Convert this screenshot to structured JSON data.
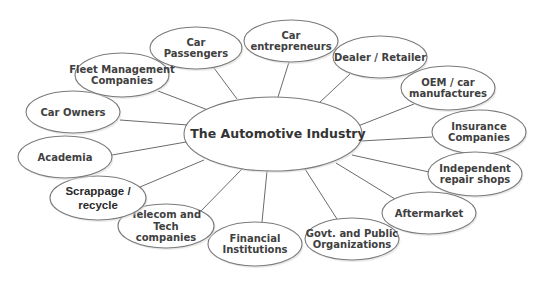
{
  "diagram": {
    "title": "The Automotive Industry",
    "center": {
      "id": "automotive-industry",
      "label": "The Automotive Industry",
      "cx": 273,
      "cy": 134,
      "rx": 89,
      "ry": 37
    },
    "colors": {
      "stroke": "#7a7a7a",
      "edge": "#6b6b6b",
      "text": "#404040",
      "fill": "#ffffff"
    },
    "nodes": [
      {
        "id": "car-passengers",
        "lines": [
          "Car",
          "Passengers"
        ],
        "cx": 196,
        "cy": 48,
        "rx": 46,
        "ry": 21,
        "edge_from": [
          237,
          99
        ],
        "edge_to": [
          214,
          68
        ]
      },
      {
        "id": "car-entrepreneurs",
        "lines": [
          "Car",
          "entrepreneurs"
        ],
        "cx": 291,
        "cy": 41,
        "rx": 47,
        "ry": 21,
        "edge_from": [
          278,
          97
        ],
        "edge_to": [
          289,
          62
        ]
      },
      {
        "id": "dealer-retailer",
        "lines": [
          "Dealer / Retailer"
        ],
        "cx": 380,
        "cy": 57,
        "rx": 47,
        "ry": 21,
        "edge_from": [
          319,
          103
        ],
        "edge_to": [
          350,
          74
        ]
      },
      {
        "id": "oem-car-manufactures",
        "lines": [
          "OEM / car",
          "manufactures"
        ],
        "cx": 448,
        "cy": 88,
        "rx": 47,
        "ry": 22,
        "edge_from": [
          358,
          126
        ],
        "edge_to": [
          414,
          104
        ]
      },
      {
        "id": "insurance-companies",
        "lines": [
          "Insurance",
          "Companies"
        ],
        "cx": 479,
        "cy": 132,
        "rx": 47,
        "ry": 22,
        "edge_from": [
          361,
          141
        ],
        "edge_to": [
          432,
          137
        ]
      },
      {
        "id": "independent-repair-shops",
        "lines": [
          "Independent",
          "repair shops"
        ],
        "cx": 475,
        "cy": 174,
        "rx": 47,
        "ry": 22,
        "edge_from": [
          352,
          155
        ],
        "edge_to": [
          429,
          172
        ]
      },
      {
        "id": "aftermarket",
        "lines": [
          "Aftermarket"
        ],
        "cx": 429,
        "cy": 213,
        "rx": 47,
        "ry": 21,
        "edge_from": [
          336,
          163
        ],
        "edge_to": [
          395,
          199
        ]
      },
      {
        "id": "govt-public-organizations",
        "lines": [
          "Govt. and Public",
          "Organizations"
        ],
        "cx": 352,
        "cy": 239,
        "rx": 47,
        "ry": 21,
        "edge_from": [
          305,
          169
        ],
        "edge_to": [
          337,
          219
        ]
      },
      {
        "id": "financial-institutions",
        "lines": [
          "Financial",
          "Institutions"
        ],
        "cx": 255,
        "cy": 244,
        "rx": 47,
        "ry": 22,
        "edge_from": [
          267,
          171
        ],
        "edge_to": [
          262,
          222
        ]
      },
      {
        "id": "telecom-tech-companies",
        "lines": [
          "Telecom and",
          "Tech",
          "companies"
        ],
        "cx": 166,
        "cy": 226,
        "rx": 48,
        "ry": 22,
        "edge_from": [
          243,
          168
        ],
        "edge_to": [
          200,
          212
        ]
      },
      {
        "id": "scrappage-recycle",
        "lines": [
          "Scrappage /",
          "recycle"
        ],
        "cx": 98,
        "cy": 198,
        "rx": 48,
        "ry": 22,
        "style": "alt",
        "edge_from": [
          204,
          160
        ],
        "edge_to": [
          140,
          187
        ]
      },
      {
        "id": "academia",
        "lines": [
          "Academia"
        ],
        "cx": 65,
        "cy": 157,
        "rx": 47,
        "ry": 21,
        "edge_from": [
          186,
          142
        ],
        "edge_to": [
          112,
          155
        ]
      },
      {
        "id": "car-owners",
        "lines": [
          "Car Owners"
        ],
        "cx": 73,
        "cy": 112,
        "rx": 47,
        "ry": 21,
        "edge_from": [
          188,
          125
        ],
        "edge_to": [
          120,
          120
        ]
      },
      {
        "id": "fleet-management-companies",
        "lines": [
          "Fleet Management",
          "Companies"
        ],
        "cx": 122,
        "cy": 75,
        "rx": 47,
        "ry": 22,
        "edge_from": [
          208,
          110
        ],
        "edge_to": [
          158,
          91
        ]
      }
    ]
  }
}
